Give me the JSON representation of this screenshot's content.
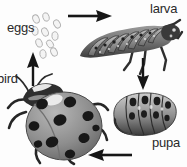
{
  "diagram": {
    "background_color": "#fdfdfd",
    "palette": {
      "ink": "#2a2a2a",
      "arrow": "#161616",
      "body_mid": "#8f8f8f",
      "body_dark": "#3a3a3a",
      "body_light": "#d8d8d8",
      "egg_outline": "#b5b5b5",
      "egg_fill": "#f2f2f2"
    },
    "labels": [
      {
        "id": "eggs",
        "text": "eggs",
        "stage": "egg"
      },
      {
        "id": "larva",
        "text": "larva",
        "stage": "larva"
      },
      {
        "id": "bird",
        "text": "bird",
        "stage": "adult"
      },
      {
        "id": "pupa",
        "text": "pupa",
        "stage": "pupa"
      }
    ],
    "arrows": [
      {
        "id": "eggs-to-larva",
        "direction": "right",
        "from": "eggs",
        "to": "larva"
      },
      {
        "id": "larva-to-pupa",
        "direction": "down",
        "from": "larva",
        "to": "pupa"
      },
      {
        "id": "pupa-to-adult",
        "direction": "left",
        "from": "pupa",
        "to": "bird"
      },
      {
        "id": "adult-to-eggs",
        "direction": "up",
        "from": "bird",
        "to": "eggs"
      }
    ],
    "organisms": [
      {
        "id": "eggs-cluster",
        "name": "eggs",
        "count": 10
      },
      {
        "id": "larva",
        "name": "larva",
        "segments": 9
      },
      {
        "id": "pupa",
        "name": "pupa",
        "segments": 6
      },
      {
        "id": "adult",
        "name": "adult ladybug beetle",
        "spots": 10
      }
    ]
  }
}
